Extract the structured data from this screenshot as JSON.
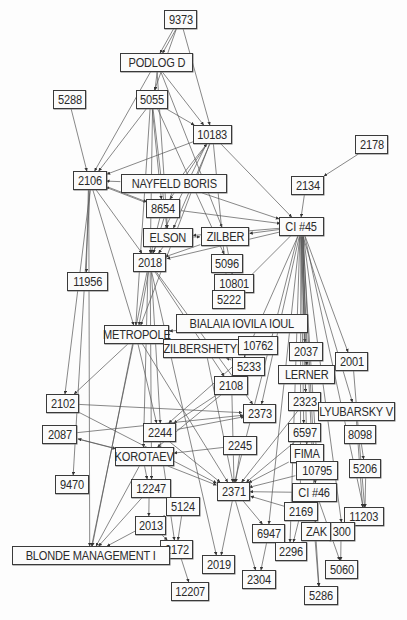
{
  "diagram": {
    "type": "directed-network",
    "colors": {
      "node_border": "#3a3a3a",
      "node_fill": "#fbfbfb",
      "edge": "#555555",
      "text": "#2a2a2a",
      "background": "#fdfdfd"
    },
    "nodes": [
      {
        "id": "9373",
        "label": "9373",
        "x": 164,
        "y": 10,
        "w": 33,
        "h": 19
      },
      {
        "id": "PODLOG D",
        "label": "PODLOG D",
        "x": 120,
        "y": 53,
        "w": 73,
        "h": 19
      },
      {
        "id": "5288",
        "label": "5288",
        "x": 53,
        "y": 90,
        "w": 33,
        "h": 19
      },
      {
        "id": "5055",
        "label": "5055",
        "x": 136,
        "y": 90,
        "w": 32,
        "h": 19
      },
      {
        "id": "10183",
        "label": "10183",
        "x": 193,
        "y": 125,
        "w": 39,
        "h": 19
      },
      {
        "id": "2178",
        "label": "2178",
        "x": 355,
        "y": 135,
        "w": 33,
        "h": 19
      },
      {
        "id": "2106",
        "label": "2106",
        "x": 73,
        "y": 171,
        "w": 34,
        "h": 19
      },
      {
        "id": "NAYFELD BORIS",
        "label": "NAYFELD BORIS",
        "x": 121,
        "y": 174,
        "w": 106,
        "h": 19
      },
      {
        "id": "2134",
        "label": "2134",
        "x": 291,
        "y": 176,
        "w": 33,
        "h": 19
      },
      {
        "id": "8654",
        "label": "8654",
        "x": 146,
        "y": 199,
        "w": 34,
        "h": 19
      },
      {
        "id": "CI #45",
        "label": "CI #45",
        "x": 279,
        "y": 217,
        "w": 45,
        "h": 19
      },
      {
        "id": "ELSON",
        "label": "ELSON",
        "x": 143,
        "y": 228,
        "w": 50,
        "h": 19
      },
      {
        "id": "ZILBER",
        "label": "ZILBER",
        "x": 201,
        "y": 227,
        "w": 48,
        "h": 19
      },
      {
        "id": "2018",
        "label": "2018",
        "x": 133,
        "y": 253,
        "w": 33,
        "h": 19
      },
      {
        "id": "5096",
        "label": "5096",
        "x": 211,
        "y": 254,
        "w": 32,
        "h": 19
      },
      {
        "id": "11956",
        "label": "11956",
        "x": 67,
        "y": 272,
        "w": 41,
        "h": 19
      },
      {
        "id": "10801",
        "label": "10801",
        "x": 214,
        "y": 274,
        "w": 40,
        "h": 19
      },
      {
        "id": "5222",
        "label": "5222",
        "x": 212,
        "y": 290,
        "w": 33,
        "h": 19
      },
      {
        "id": "BIALAIA IOVILA IOUL",
        "label": "BIALAIA IOVILA IOUL",
        "x": 176,
        "y": 314,
        "w": 132,
        "h": 19
      },
      {
        "id": "METROPOLE",
        "label": "METROPOLE",
        "x": 104,
        "y": 325,
        "w": 65,
        "h": 19
      },
      {
        "id": "ZILBERSHETYN",
        "label": "ZILBERSHETYN",
        "x": 163,
        "y": 339,
        "w": 82,
        "h": 19
      },
      {
        "id": "10762",
        "label": "10762",
        "x": 238,
        "y": 336,
        "w": 40,
        "h": 19
      },
      {
        "id": "2037",
        "label": "2037",
        "x": 289,
        "y": 342,
        "w": 34,
        "h": 19
      },
      {
        "id": "2001",
        "label": "2001",
        "x": 335,
        "y": 352,
        "w": 33,
        "h": 19
      },
      {
        "id": "5233",
        "label": "5233",
        "x": 232,
        "y": 357,
        "w": 33,
        "h": 19
      },
      {
        "id": "LERNER",
        "label": "LERNER",
        "x": 278,
        "y": 365,
        "w": 57,
        "h": 19
      },
      {
        "id": "2108",
        "label": "2108",
        "x": 214,
        "y": 376,
        "w": 34,
        "h": 19
      },
      {
        "id": "2102",
        "label": "2102",
        "x": 46,
        "y": 394,
        "w": 33,
        "h": 19
      },
      {
        "id": "2323",
        "label": "2323",
        "x": 288,
        "y": 392,
        "w": 33,
        "h": 19
      },
      {
        "id": "LYUBARSKY V",
        "label": "LYUBARSKY V",
        "x": 318,
        "y": 402,
        "w": 77,
        "h": 19
      },
      {
        "id": "2373",
        "label": "2373",
        "x": 243,
        "y": 404,
        "w": 33,
        "h": 19
      },
      {
        "id": "2087",
        "label": "2087",
        "x": 42,
        "y": 425,
        "w": 35,
        "h": 19
      },
      {
        "id": "2244",
        "label": "2244",
        "x": 143,
        "y": 423,
        "w": 33,
        "h": 19
      },
      {
        "id": "6597",
        "label": "6597",
        "x": 288,
        "y": 423,
        "w": 33,
        "h": 19
      },
      {
        "id": "8098",
        "label": "8098",
        "x": 344,
        "y": 425,
        "w": 32,
        "h": 19
      },
      {
        "id": "2245",
        "label": "2245",
        "x": 223,
        "y": 436,
        "w": 34,
        "h": 19
      },
      {
        "id": "KOROTAEV",
        "label": "KOROTAEV",
        "x": 115,
        "y": 447,
        "w": 59,
        "h": 19
      },
      {
        "id": "FIMA",
        "label": "FIMA",
        "x": 290,
        "y": 444,
        "w": 34,
        "h": 19
      },
      {
        "id": "10795",
        "label": "10795",
        "x": 296,
        "y": 461,
        "w": 42,
        "h": 19
      },
      {
        "id": "5206",
        "label": "5206",
        "x": 349,
        "y": 459,
        "w": 32,
        "h": 19
      },
      {
        "id": "9470",
        "label": "9470",
        "x": 55,
        "y": 475,
        "w": 34,
        "h": 19
      },
      {
        "id": "12247",
        "label": "12247",
        "x": 131,
        "y": 479,
        "w": 40,
        "h": 19
      },
      {
        "id": "2371",
        "label": "2371",
        "x": 217,
        "y": 482,
        "w": 33,
        "h": 19
      },
      {
        "id": "CI #46",
        "label": "CI #46",
        "x": 292,
        "y": 483,
        "w": 45,
        "h": 19
      },
      {
        "id": "5124",
        "label": "5124",
        "x": 166,
        "y": 497,
        "w": 34,
        "h": 19
      },
      {
        "id": "2169",
        "label": "2169",
        "x": 284,
        "y": 502,
        "w": 34,
        "h": 19
      },
      {
        "id": "11203",
        "label": "11203",
        "x": 344,
        "y": 507,
        "w": 40,
        "h": 19
      },
      {
        "id": "2013",
        "label": "2013",
        "x": 135,
        "y": 516,
        "w": 31,
        "h": 19
      },
      {
        "id": "6947",
        "label": "6947",
        "x": 252,
        "y": 524,
        "w": 33,
        "h": 19
      },
      {
        "id": "300",
        "label": "300",
        "x": 329,
        "y": 522,
        "w": 26,
        "h": 19
      },
      {
        "id": "ZAK",
        "label": "ZAK",
        "x": 301,
        "y": 522,
        "w": 30,
        "h": 19
      },
      {
        "id": "2172",
        "label": "2172",
        "x": 160,
        "y": 540,
        "w": 33,
        "h": 19
      },
      {
        "id": "BLONDE MANAGEMENT I",
        "label": "BLONDE MANAGEMENT I",
        "x": 12,
        "y": 546,
        "w": 158,
        "h": 19
      },
      {
        "id": "2296",
        "label": "2296",
        "x": 275,
        "y": 542,
        "w": 32,
        "h": 19
      },
      {
        "id": "2019",
        "label": "2019",
        "x": 202,
        "y": 555,
        "w": 33,
        "h": 19
      },
      {
        "id": "5060",
        "label": "5060",
        "x": 325,
        "y": 560,
        "w": 33,
        "h": 19
      },
      {
        "id": "2304",
        "label": "2304",
        "x": 242,
        "y": 570,
        "w": 34,
        "h": 19
      },
      {
        "id": "12207",
        "label": "12207",
        "x": 171,
        "y": 582,
        "w": 38,
        "h": 19
      },
      {
        "id": "5286",
        "label": "5286",
        "x": 304,
        "y": 586,
        "w": 34,
        "h": 19
      }
    ],
    "edges": [
      [
        "9373",
        "PODLOG D"
      ],
      [
        "9373",
        "5055"
      ],
      [
        "9373",
        "10183"
      ],
      [
        "9373",
        "PODLOG D"
      ],
      [
        "PODLOG D",
        "5055"
      ],
      [
        "PODLOG D",
        "10183"
      ],
      [
        "PODLOG D",
        "2106"
      ],
      [
        "PODLOG D",
        "ELSON"
      ],
      [
        "PODLOG D",
        "ZILBER"
      ],
      [
        "5055",
        "2106"
      ],
      [
        "5055",
        "10183"
      ],
      [
        "5055",
        "8654"
      ],
      [
        "5055",
        "ELSON"
      ],
      [
        "5055",
        "2018"
      ],
      [
        "5055",
        "5096"
      ],
      [
        "5055",
        "METROPOLE"
      ],
      [
        "5288",
        "2106"
      ],
      [
        "10183",
        "2106"
      ],
      [
        "10183",
        "8654"
      ],
      [
        "10183",
        "ELSON"
      ],
      [
        "10183",
        "2018"
      ],
      [
        "10183",
        "CI #45"
      ],
      [
        "10183",
        "5222"
      ],
      [
        "10183",
        "METROPOLE"
      ],
      [
        "2178",
        "2134"
      ],
      [
        "2134",
        "CI #45"
      ],
      [
        "NAYFELD BORIS",
        "2106"
      ],
      [
        "NAYFELD BORIS",
        "CI #45"
      ],
      [
        "NAYFELD BORIS",
        "2018"
      ],
      [
        "NAYFELD BORIS",
        "10183"
      ],
      [
        "2106",
        "11956"
      ],
      [
        "2106",
        "2018"
      ],
      [
        "2106",
        "METROPOLE"
      ],
      [
        "2106",
        "8654"
      ],
      [
        "8654",
        "CI #45"
      ],
      [
        "8654",
        "2106"
      ],
      [
        "8654",
        "2018"
      ],
      [
        "CI #45",
        "ELSON"
      ],
      [
        "CI #45",
        "ZILBER"
      ],
      [
        "CI #45",
        "2018"
      ],
      [
        "CI #45",
        "5222"
      ],
      [
        "CI #45",
        "2037"
      ],
      [
        "CI #45",
        "2001"
      ],
      [
        "CI #45",
        "LERNER"
      ],
      [
        "CI #45",
        "2323"
      ],
      [
        "CI #45",
        "LYUBARSKY V"
      ],
      [
        "CI #45",
        "6597"
      ],
      [
        "CI #45",
        "FIMA"
      ],
      [
        "CI #45",
        "10795"
      ],
      [
        "CI #45",
        "CI #46"
      ],
      [
        "CI #45",
        "2371"
      ],
      [
        "CI #45",
        "2169"
      ],
      [
        "CI #45",
        "ZAK"
      ],
      [
        "CI #45",
        "300"
      ],
      [
        "CI #45",
        "11203"
      ],
      [
        "CI #45",
        "2296"
      ],
      [
        "CI #45",
        "6947"
      ],
      [
        "CI #45",
        "2373"
      ],
      [
        "CI #45",
        "2108"
      ],
      [
        "ELSON",
        "2018"
      ],
      [
        "ELSON",
        "ZILBER"
      ],
      [
        "ZILBER",
        "2018"
      ],
      [
        "ZILBER",
        "10801"
      ],
      [
        "2018",
        "METROPOLE"
      ],
      [
        "2018",
        "2244"
      ],
      [
        "2018",
        "KOROTAEV"
      ],
      [
        "2018",
        "2108"
      ],
      [
        "2018",
        "2373"
      ],
      [
        "2018",
        "12247"
      ],
      [
        "METROPOLE",
        "2102"
      ],
      [
        "METROPOLE",
        "BLONDE MANAGEMENT I"
      ],
      [
        "METROPOLE",
        "2244"
      ],
      [
        "METROPOLE",
        "2371"
      ],
      [
        "BIALAIA IOVILA IOUL",
        "METROPOLE"
      ],
      [
        "ZILBERSHETYN",
        "2371"
      ],
      [
        "10762",
        "2244"
      ],
      [
        "5233",
        "ZILBERSHETYN"
      ],
      [
        "2108",
        "2244"
      ],
      [
        "2108",
        "2371"
      ],
      [
        "2108",
        "KOROTAEV"
      ],
      [
        "2102",
        "2373"
      ],
      [
        "2102",
        "2371"
      ],
      [
        "2087",
        "2373"
      ],
      [
        "2087",
        "KOROTAEV"
      ],
      [
        "2244",
        "2373"
      ],
      [
        "2244",
        "2371"
      ],
      [
        "2244",
        "2172"
      ],
      [
        "2245",
        "KOROTAEV"
      ],
      [
        "2245",
        "2371"
      ],
      [
        "KOROTAEV",
        "2087"
      ],
      [
        "KOROTAEV",
        "12247"
      ],
      [
        "KOROTAEV",
        "2371"
      ],
      [
        "KOROTAEV",
        "BLONDE MANAGEMENT I"
      ],
      [
        "2323",
        "2371"
      ],
      [
        "6597",
        "2371"
      ],
      [
        "FIMA",
        "2371"
      ],
      [
        "10795",
        "2371"
      ],
      [
        "CI #46",
        "2371"
      ],
      [
        "2169",
        "2371"
      ],
      [
        "CI #46",
        "5060"
      ],
      [
        "CI #46",
        "5286"
      ],
      [
        "LYUBARSKY V",
        "11203"
      ],
      [
        "8098",
        "5206"
      ],
      [
        "5206",
        "11203"
      ],
      [
        "2001",
        "11203"
      ],
      [
        "12247",
        "2013"
      ],
      [
        "12247",
        "BLONDE MANAGEMENT I"
      ],
      [
        "5124",
        "2172"
      ],
      [
        "2013",
        "2172"
      ],
      [
        "2172",
        "12207"
      ],
      [
        "5124",
        "BLONDE MANAGEMENT I"
      ],
      [
        "2371",
        "2304"
      ],
      [
        "6947",
        "2304"
      ],
      [
        "2371",
        "2019"
      ],
      [
        "2371",
        "6947"
      ],
      [
        "ZAK",
        "5286"
      ],
      [
        "300",
        "5060"
      ],
      [
        "2169",
        "2296"
      ],
      [
        "2106",
        "9470"
      ],
      [
        "2106",
        "2102"
      ],
      [
        "2106",
        "BLONDE MANAGEMENT I"
      ],
      [
        "2018",
        "BLONDE MANAGEMENT I"
      ],
      [
        "2018",
        "2019"
      ]
    ]
  }
}
